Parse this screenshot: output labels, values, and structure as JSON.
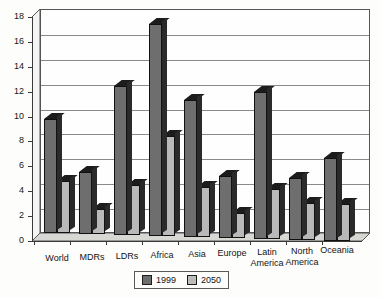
{
  "chart_data": {
    "type": "bar",
    "title": "",
    "subtitle": "",
    "xlabel": "",
    "ylabel": "",
    "ylim": [
      0,
      18
    ],
    "ytick_step": 2,
    "yticks": [
      "0",
      "2",
      "4",
      "6",
      "8",
      "10",
      "12",
      "14",
      "16",
      "18"
    ],
    "grid": true,
    "legend_position": "bottom-center",
    "style": "3d-clustered-column",
    "categories": [
      "World",
      "MDRs",
      "LDRs",
      "Africa",
      "Asia",
      "Europe",
      "Latin\nAmerica",
      "North\nAmerica",
      "Oceania"
    ],
    "series": [
      {
        "name": "1999",
        "color": "#6e6e6e",
        "values": [
          9.2,
          5.0,
          12.0,
          17.0,
          11.0,
          5.0,
          11.8,
          5.0,
          6.7
        ]
      },
      {
        "name": "2050",
        "color": "#b9b9b9",
        "values": [
          4.2,
          2.0,
          4.0,
          8.0,
          4.0,
          2.0,
          4.0,
          3.0,
          3.0
        ]
      }
    ]
  },
  "legend": {
    "items": [
      {
        "label": "1999",
        "color": "#6e6e6e"
      },
      {
        "label": "2050",
        "color": "#b9b9b9"
      }
    ]
  },
  "colors": {
    "series_1999": "#6e6e6e",
    "series_2050": "#b9b9b9",
    "axis": "#3a3a3a",
    "gridline": "#8a8a8a",
    "background": "#fdfdfb",
    "plot_background": "#fefefe"
  }
}
